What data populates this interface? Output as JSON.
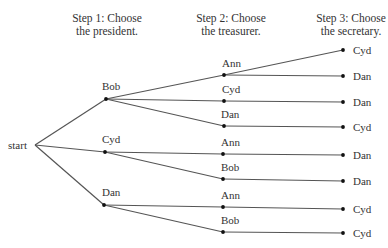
{
  "headers": {
    "step1": {
      "line1": "Step 1: Choose",
      "line2": "the president."
    },
    "step2": {
      "line1": "Step 2: Choose",
      "line2": "the treasurer."
    },
    "step3": {
      "line1": "Step 3: Choose",
      "line2": "the secretary."
    }
  },
  "root": {
    "label": "start"
  },
  "tree": [
    {
      "president": "Bob",
      "branches": [
        {
          "treasurer": "Ann",
          "secretary": "Cyd"
        },
        {
          "treasurer": "Ann",
          "secretary": "Dan"
        },
        {
          "treasurer": "Cyd",
          "secretary": "Dan"
        },
        {
          "treasurer": "Dan",
          "secretary": "Cyd"
        }
      ]
    },
    {
      "president": "Cyd",
      "branches": [
        {
          "treasurer": "Ann",
          "secretary": "Dan"
        },
        {
          "treasurer": "Bob",
          "secretary": "Dan"
        }
      ]
    },
    {
      "president": "Dan",
      "branches": [
        {
          "treasurer": "Ann",
          "secretary": "Cyd"
        },
        {
          "treasurer": "Bob",
          "secretary": "Cyd"
        }
      ]
    }
  ],
  "labels": {
    "p1": "Bob",
    "p2": "Cyd",
    "p3": "Dan",
    "t1": "Ann",
    "t2": "Cyd",
    "t3": "Dan",
    "t4": "Ann",
    "t5": "Bob",
    "t6": "Ann",
    "t7": "Bob",
    "s1": "Cyd",
    "s2": "Dan",
    "s3": "Dan",
    "s4": "Cyd",
    "s5": "Dan",
    "s6": "Dan",
    "s7": "Cyd",
    "s8": "Cyd"
  },
  "colors": {
    "line": "#555555",
    "dot": "#111111",
    "text": "#333333"
  }
}
